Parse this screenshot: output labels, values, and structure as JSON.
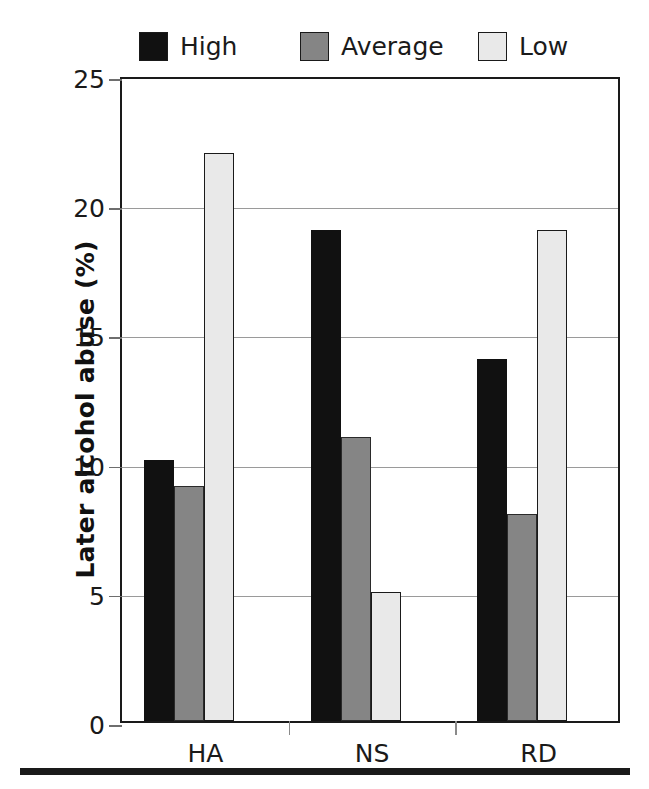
{
  "chart_data": {
    "type": "bar",
    "title": "",
    "xlabel": "",
    "ylabel": "Later alcohol abuse (%)",
    "categories": [
      "HA",
      "NS",
      "RD"
    ],
    "series": [
      {
        "name": "High",
        "color": "#111111",
        "values": [
          10.1,
          19,
          14
        ]
      },
      {
        "name": "Average",
        "color": "#858585",
        "values": [
          9.1,
          11,
          8
        ]
      },
      {
        "name": "Low",
        "color": "#e9e9e9",
        "values": [
          22,
          5,
          19
        ]
      }
    ],
    "ylim": [
      0,
      25
    ],
    "yticks": [
      0,
      5,
      10,
      15,
      20,
      25
    ],
    "ytick_labels": [
      "0",
      "5",
      "10",
      "15",
      "20",
      "25"
    ],
    "grid": true,
    "legend_position": "top"
  },
  "legend": {
    "entries": [
      {
        "label": "High",
        "swatch": "#111111"
      },
      {
        "label": "Average",
        "swatch": "#858585"
      },
      {
        "label": "Low",
        "swatch": "#e9e9e9"
      }
    ]
  },
  "axes": {
    "y_title": "Later alcohol abuse (%)",
    "y_tick_labels": [
      "25",
      "20",
      "15",
      "10",
      "5",
      "0"
    ],
    "x_tick_labels": [
      "HA",
      "NS",
      "RD"
    ]
  }
}
